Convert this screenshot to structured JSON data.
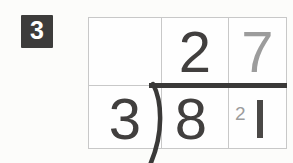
{
  "question_number": "3",
  "division_problem": {
    "divisor": "3",
    "dividend_tens": "8",
    "dividend_ones": "1",
    "quotient_tens": "2",
    "quotient_ones": "7",
    "carry": "2"
  },
  "colors": {
    "digit_dark": "#413f3e",
    "digit_gray": "#9c9c9c",
    "grid_line": "#c8c8c8",
    "division_bar": "#3a3938",
    "badge_background": "#3d3c3b",
    "badge_text": "#ffffff",
    "page_background": "#fcfcfa"
  }
}
